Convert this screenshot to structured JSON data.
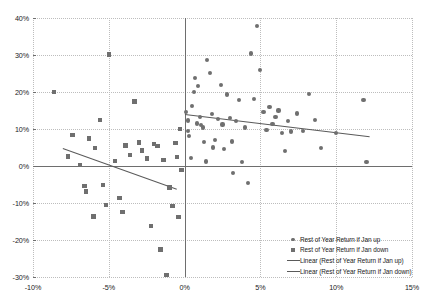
{
  "chart_data": {
    "type": "scatter",
    "title": "",
    "xlabel": "",
    "ylabel": "",
    "xlim": [
      -10,
      15
    ],
    "ylim": [
      -30,
      40
    ],
    "grid": true,
    "legend_position": "inside-bottom-right",
    "x_ticks": [
      "-10%",
      "-5%",
      "0%",
      "5%",
      "10%",
      "15%"
    ],
    "x_tick_values": [
      -10,
      -5,
      0,
      5,
      10,
      15
    ],
    "y_ticks": [
      "40%",
      "30%",
      "20%",
      "10%",
      "0%",
      "-10%",
      "-20%",
      "-30%"
    ],
    "y_tick_values": [
      40,
      30,
      20,
      10,
      0,
      -10,
      -20,
      -30
    ],
    "series": [
      {
        "name": "Rest of Year Return if Jan up",
        "marker": "circle",
        "color": "#6f6f6f",
        "points": [
          [
            0.1,
            14.6
          ],
          [
            0.2,
            12.3
          ],
          [
            0.2,
            9.4
          ],
          [
            0.3,
            8.0
          ],
          [
            0.4,
            2.2
          ],
          [
            0.5,
            16.3
          ],
          [
            0.6,
            19.9
          ],
          [
            0.7,
            23.8
          ],
          [
            0.8,
            11.5
          ],
          [
            0.9,
            21.6
          ],
          [
            1.0,
            13.2
          ],
          [
            1.1,
            11.0
          ],
          [
            1.2,
            10.4
          ],
          [
            1.3,
            6.4
          ],
          [
            1.4,
            1.2
          ],
          [
            1.5,
            28.6
          ],
          [
            1.7,
            25.2
          ],
          [
            1.8,
            14.1
          ],
          [
            1.9,
            5.0
          ],
          [
            2.0,
            7.1
          ],
          [
            2.2,
            12.7
          ],
          [
            2.4,
            22.0
          ],
          [
            2.5,
            11.2
          ],
          [
            2.6,
            4.5
          ],
          [
            2.8,
            19.3
          ],
          [
            3.0,
            13.0
          ],
          [
            3.1,
            6.6
          ],
          [
            3.2,
            -1.9
          ],
          [
            3.4,
            12.1
          ],
          [
            3.6,
            17.8
          ],
          [
            3.8,
            1.0
          ],
          [
            4.0,
            10.4
          ],
          [
            4.2,
            -4.6
          ],
          [
            4.4,
            30.4
          ],
          [
            4.6,
            18.0
          ],
          [
            4.8,
            37.8
          ],
          [
            5.0,
            26.0
          ],
          [
            5.2,
            14.6
          ],
          [
            5.4,
            9.8
          ],
          [
            5.6,
            16.0
          ],
          [
            5.8,
            11.4
          ],
          [
            6.0,
            13.2
          ],
          [
            6.2,
            15.0
          ],
          [
            6.4,
            9.0
          ],
          [
            6.6,
            4.0
          ],
          [
            6.8,
            12.2
          ],
          [
            7.0,
            9.3
          ],
          [
            7.4,
            14.2
          ],
          [
            7.8,
            9.4
          ],
          [
            8.2,
            19.4
          ],
          [
            8.6,
            12.4
          ],
          [
            9.0,
            4.9
          ],
          [
            10.0,
            9.0
          ],
          [
            11.8,
            17.8
          ],
          [
            12.0,
            1.0
          ]
        ]
      },
      {
        "name": "Rest of Year Return if Jan down",
        "marker": "square",
        "color": "#6f6f6f",
        "points": [
          [
            -8.6,
            20.0
          ],
          [
            -7.7,
            2.6
          ],
          [
            -7.4,
            8.4
          ],
          [
            -6.9,
            0.2
          ],
          [
            -6.6,
            -5.4
          ],
          [
            -6.5,
            -6.9
          ],
          [
            -6.3,
            7.4
          ],
          [
            -6.0,
            -13.6
          ],
          [
            -5.9,
            4.8
          ],
          [
            -5.6,
            12.4
          ],
          [
            -5.4,
            -5.1
          ],
          [
            -5.2,
            -10.6
          ],
          [
            -5.0,
            30.1
          ],
          [
            -4.6,
            1.4
          ],
          [
            -4.3,
            -8.6
          ],
          [
            -4.1,
            -12.4
          ],
          [
            -3.9,
            5.5
          ],
          [
            -3.6,
            3.0
          ],
          [
            -3.3,
            17.4
          ],
          [
            -3.0,
            6.4
          ],
          [
            -2.8,
            4.2
          ],
          [
            -2.5,
            2.0
          ],
          [
            -2.2,
            -16.2
          ],
          [
            -2.0,
            6.0
          ],
          [
            -1.8,
            5.4
          ],
          [
            -1.6,
            -22.6
          ],
          [
            -1.4,
            1.6
          ],
          [
            -1.2,
            -29.5
          ],
          [
            -1.0,
            -5.8
          ],
          [
            -0.8,
            -10.8
          ],
          [
            -0.6,
            6.3
          ],
          [
            -0.5,
            2.4
          ],
          [
            -0.4,
            -13.8
          ],
          [
            -0.3,
            10.0
          ],
          [
            -0.2,
            -1.0
          ]
        ]
      }
    ],
    "trendlines": [
      {
        "name": "Linear (Rest of Year Return if Jan up)",
        "color": "#5a5a5a",
        "x0": 0.0,
        "y0": 14.0,
        "x1": 12.2,
        "y1": 8.0
      },
      {
        "name": "Linear (Rest of Year Return if Jan down)",
        "color": "#5a5a5a",
        "x0": -8.0,
        "y0": 5.0,
        "x1": -0.5,
        "y1": -6.0
      }
    ],
    "legend": [
      {
        "label": "Rest of Year Return if Jan up",
        "mark": "circle"
      },
      {
        "label": "Rest of Year Return if Jan down",
        "mark": "square"
      },
      {
        "label": "Linear (Rest of Year Return if Jan up)",
        "mark": "line"
      },
      {
        "label": "Linear (Rest of Year Return if Jan down)",
        "mark": "line"
      }
    ]
  }
}
